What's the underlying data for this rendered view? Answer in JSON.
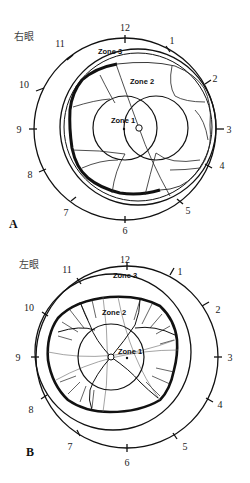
{
  "figure": {
    "panels": [
      {
        "id": "A",
        "panel_label": "A",
        "eye_label": "右眼",
        "clock_hours": [
          "12",
          "1",
          "2",
          "3",
          "4",
          "5",
          "6",
          "7",
          "8",
          "9",
          "10",
          "11"
        ],
        "zones": {
          "zone1": "Zone 1",
          "zone2": "Zone 2",
          "zone3": "Zone 3"
        }
      },
      {
        "id": "B",
        "panel_label": "B",
        "eye_label": "左眼",
        "clock_hours": [
          "12",
          "1",
          "2",
          "3",
          "4",
          "5",
          "6",
          "7",
          "8",
          "9",
          "10",
          "11"
        ],
        "zones": {
          "zone1": "Zone 1",
          "zone2": "Zone 2",
          "zone3": "Zone 3"
        }
      }
    ],
    "colors": {
      "ink": "#111111",
      "thin_ink": "#555555",
      "background": "#ffffff"
    }
  }
}
